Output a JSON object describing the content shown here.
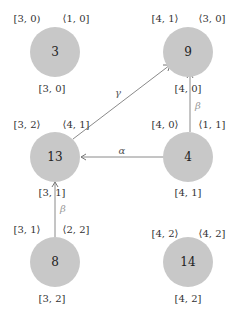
{
  "diagram": {
    "type": "graph",
    "nodes": [
      {
        "id": "n3",
        "label": "3",
        "cx": 55,
        "cy": 48,
        "top_left": "[3, 0)",
        "top_right": "⟨1, 0]",
        "bottom": "[3, 0]"
      },
      {
        "id": "n9",
        "label": "9",
        "cx": 190,
        "cy": 48,
        "top_left": "[4, 1⟩",
        "top_right": "⟨3, 0]",
        "bottom": "[4, 0]"
      },
      {
        "id": "n13",
        "label": "13",
        "cx": 55,
        "cy": 157,
        "top_left": "[3, 2⟩",
        "top_right": "⟨4, 1]",
        "bottom": "[3, 1]"
      },
      {
        "id": "n4",
        "label": "4",
        "cx": 190,
        "cy": 157,
        "top_left": "[4, 0⟩",
        "top_right": "⟨1, 1]",
        "bottom": "[4, 1]"
      },
      {
        "id": "n8",
        "label": "8",
        "cx": 55,
        "cy": 262,
        "top_left": "[3, 1⟩",
        "top_right": "⟨2, 2]",
        "bottom": "[3, 2]"
      },
      {
        "id": "n14",
        "label": "14",
        "cx": 190,
        "cy": 262,
        "top_left": "[4, 2⟩",
        "top_right": "⟨4, 2]",
        "bottom": "[4, 2]"
      }
    ],
    "edges": [
      {
        "from": "n13",
        "to": "n9",
        "label": "γ",
        "color": "#555555"
      },
      {
        "from": "n4",
        "to": "n13",
        "label": "α",
        "color": "#555555"
      },
      {
        "from": "n4",
        "to": "n9",
        "label": "β",
        "color": "#999999"
      },
      {
        "from": "n8",
        "to": "n13",
        "label": "β",
        "color": "#999999"
      }
    ],
    "colors": {
      "node_fill": "#c8c8c8",
      "edge": "#8a8a8a"
    }
  }
}
